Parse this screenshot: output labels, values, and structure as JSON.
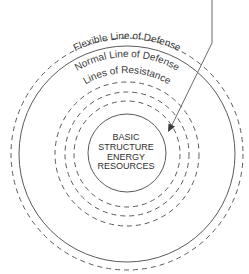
{
  "diagram": {
    "labels": {
      "flexible": "Flexible Line of Defense",
      "normal": "Normal Line of Defense",
      "resistance": "Lines of Resistance"
    },
    "core": {
      "lines": [
        "BASIC",
        "STRUCTURE",
        "ENERGY",
        "RESOURCES"
      ]
    },
    "rings": [
      {
        "name": "flexible-line-of-defense",
        "style": "dashed",
        "radius": 116
      },
      {
        "name": "normal-line-of-defense",
        "style": "solid",
        "radius": 108
      },
      {
        "name": "line-of-resistance-outer",
        "style": "dashed",
        "radius": 72
      },
      {
        "name": "line-of-resistance-middle",
        "style": "dashed",
        "radius": 62
      },
      {
        "name": "line-of-resistance-inner",
        "style": "dashed",
        "radius": 53
      },
      {
        "name": "basic-structure",
        "style": "solid",
        "radius": 39
      }
    ],
    "colors": {
      "stroke": "#5a5a5a",
      "text": "#3a3a3a",
      "background": "#ffffff"
    }
  }
}
